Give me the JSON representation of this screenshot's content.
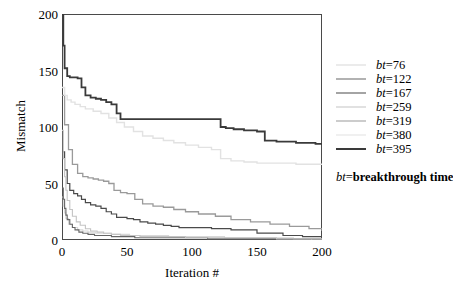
{
  "chart_data": {
    "type": "line",
    "title": "",
    "xlabel": "Iteration #",
    "ylabel": "Mismatch",
    "xlim": [
      0,
      200
    ],
    "ylim": [
      0,
      200
    ],
    "xticks": [
      0,
      50,
      100,
      150,
      200
    ],
    "yticks": [
      0,
      50,
      100,
      150,
      200
    ],
    "grid": false,
    "legend_position": "right",
    "legend_note_prefix": "bt",
    "legend_note_equals": "=",
    "legend_note_text": "breakthrough time",
    "series": [
      {
        "name": "bt=76",
        "label_prefix": "bt",
        "label_value": "=76",
        "color": "#d8d8d8",
        "width": 1.1,
        "x": [
          0,
          1,
          2,
          3,
          5,
          8,
          12,
          16,
          20,
          26,
          32,
          38,
          45,
          52,
          60,
          70,
          82,
          95,
          110,
          125,
          140,
          155,
          170,
          178,
          185,
          192,
          200
        ],
        "y": [
          38,
          30,
          24,
          19,
          14,
          11,
          9,
          8,
          7,
          6,
          6,
          5,
          5,
          4,
          4,
          4,
          3,
          3,
          3,
          2,
          2,
          2,
          2,
          1,
          1,
          0,
          0
        ]
      },
      {
        "name": "bt=122",
        "label_prefix": "bt",
        "label_value": "=122",
        "color": "#666666",
        "width": 1.1,
        "x": [
          0,
          1,
          2,
          3,
          4,
          6,
          8,
          10,
          13,
          16,
          20,
          25,
          30,
          38,
          46,
          56,
          68,
          80,
          95,
          112,
          130,
          150,
          170,
          185,
          200
        ],
        "y": [
          46,
          36,
          28,
          22,
          18,
          14,
          11,
          9,
          7,
          6,
          5,
          4,
          4,
          3,
          3,
          2,
          2,
          2,
          2,
          1,
          1,
          1,
          1,
          1,
          1
        ]
      },
      {
        "name": "bt=167",
        "label_prefix": "bt",
        "label_value": "=167",
        "color": "#4a4a4a",
        "width": 1.2,
        "x": [
          0,
          2,
          4,
          6,
          9,
          12,
          15,
          18,
          22,
          26,
          30,
          34,
          38,
          42,
          46,
          50,
          55,
          60,
          66,
          72,
          78,
          84,
          90,
          100,
          115,
          130,
          150,
          170,
          185,
          200
        ],
        "y": [
          78,
          62,
          50,
          44,
          41,
          39,
          36,
          33,
          31,
          30,
          28,
          25,
          23,
          20,
          20,
          19,
          18,
          16,
          15,
          14,
          13,
          12,
          11,
          11,
          10,
          9,
          6,
          4,
          3,
          2
        ]
      },
      {
        "name": "bt=259",
        "label_prefix": "bt",
        "label_value": "=259",
        "color": "#c4c4c4",
        "width": 1.1,
        "x": [
          0,
          1,
          2,
          3,
          4,
          6,
          8,
          11,
          14,
          18,
          22,
          27,
          32,
          38,
          45,
          52,
          60,
          70,
          82,
          95,
          110,
          128,
          145,
          165,
          182,
          200
        ],
        "y": [
          97,
          72,
          56,
          44,
          35,
          27,
          21,
          16,
          13,
          10,
          8,
          7,
          6,
          5,
          4,
          4,
          3,
          3,
          3,
          2,
          2,
          2,
          2,
          1,
          1,
          1
        ]
      },
      {
        "name": "bt=319",
        "label_prefix": "bt",
        "label_value": "=319",
        "color": "#9a9a9a",
        "width": 1.3,
        "x": [
          0,
          2,
          5,
          8,
          12,
          16,
          20,
          24,
          28,
          32,
          36,
          40,
          45,
          50,
          56,
          62,
          70,
          78,
          86,
          95,
          105,
          118,
          130,
          145,
          160,
          175,
          190,
          200
        ],
        "y": [
          128,
          102,
          80,
          67,
          59,
          56,
          55,
          54,
          53,
          52,
          50,
          44,
          42,
          41,
          36,
          32,
          30,
          29,
          27,
          25,
          23,
          21,
          18,
          16,
          14,
          12,
          10,
          8
        ]
      },
      {
        "name": "bt=380",
        "label_prefix": "bt",
        "label_value": "=380",
        "color": "#e2e2e2",
        "width": 1.4,
        "x": [
          0,
          2,
          4,
          7,
          10,
          14,
          18,
          24,
          30,
          36,
          42,
          48,
          55,
          62,
          70,
          78,
          86,
          95,
          105,
          115,
          122,
          130,
          140,
          150,
          165,
          180,
          195,
          200
        ],
        "y": [
          135,
          128,
          124,
          122,
          120,
          118,
          116,
          114,
          112,
          108,
          104,
          100,
          96,
          92,
          90,
          88,
          86,
          84,
          82,
          80,
          72,
          70,
          69,
          68,
          68,
          67,
          67,
          67
        ]
      },
      {
        "name": "bt=395",
        "label_prefix": "bt",
        "label_value": "=395",
        "color": "#3a3a3a",
        "width": 1.8,
        "x": [
          0,
          1,
          2,
          4,
          6,
          9,
          12,
          15,
          18,
          22,
          26,
          30,
          34,
          38,
          42,
          45,
          50,
          60,
          75,
          90,
          105,
          118,
          122,
          126,
          132,
          140,
          150,
          156,
          165,
          180,
          195,
          200
        ],
        "y": [
          200,
          172,
          152,
          145,
          144,
          144,
          143,
          135,
          128,
          126,
          125,
          124,
          122,
          120,
          112,
          107,
          107,
          107,
          107,
          107,
          107,
          107,
          100,
          99,
          98,
          97,
          96,
          88,
          87,
          86,
          85,
          85
        ]
      }
    ]
  }
}
